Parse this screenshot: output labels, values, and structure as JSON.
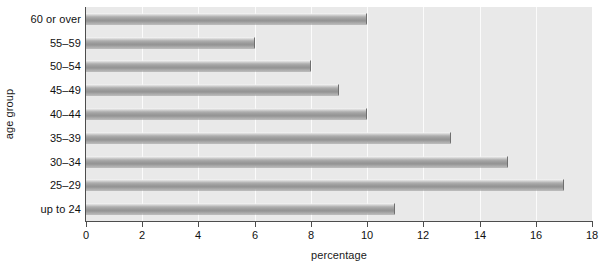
{
  "chart_data": {
    "type": "bar",
    "orientation": "horizontal",
    "title": "",
    "xlabel": "percentage",
    "ylabel": "age group",
    "categories": [
      "up to 24",
      "25–29",
      "30–34",
      "35–39",
      "40–44",
      "45–49",
      "50–54",
      "55–59",
      "60 or over"
    ],
    "values": [
      11,
      17,
      15,
      13,
      10,
      9,
      8,
      6,
      10
    ],
    "xlim": [
      0,
      18
    ],
    "xticks": [
      0,
      2,
      4,
      6,
      8,
      10,
      12,
      14,
      16,
      18
    ],
    "xtick_labels": [
      "0",
      "2",
      "4",
      "6",
      "8",
      "10",
      "12",
      "14",
      "16",
      "18"
    ],
    "grid": "vertical",
    "legend": "none",
    "bar_color": "#9b9b9b",
    "plot_background": "#e9e9e9",
    "gridline_color": "#fbfbfb",
    "axis_color": "#4d4d4d"
  }
}
